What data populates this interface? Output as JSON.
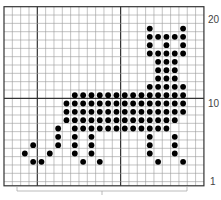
{
  "chart": {
    "title": "",
    "columns": 24,
    "rows_total": 21,
    "grid": {
      "left": 4,
      "top": 6.7,
      "cell": 8.33,
      "cell_h": 8.33,
      "visible_rows": 21.5,
      "line_color": "#9a9a9a",
      "major_line_color": "#333333",
      "border_color": "#333333",
      "major_columns_after": [
        4,
        14
      ],
      "major_rows_above": [
        10
      ]
    },
    "dot_color": "#000000",
    "row_labels": [
      {
        "row": 20,
        "text": "20"
      },
      {
        "row": 10,
        "text": "10"
      },
      {
        "row": 1,
        "text": "1"
      }
    ],
    "stitches": {
      "19": [
        18,
        22
      ],
      "18": [
        18,
        19,
        20,
        21,
        22
      ],
      "17": [
        18,
        20,
        22
      ],
      "16": [
        18,
        19,
        20,
        21,
        22
      ],
      "15": [
        19,
        20,
        21
      ],
      "14": [
        19,
        20,
        21
      ],
      "13": [
        19,
        20,
        21
      ],
      "12": [
        18,
        19,
        20,
        21,
        22
      ],
      "11": [
        9,
        10,
        11,
        12,
        13,
        14,
        15,
        16,
        17,
        18,
        19,
        20,
        21,
        22
      ],
      "10": [
        8,
        9,
        10,
        11,
        12,
        13,
        14,
        15,
        16,
        17,
        18,
        19,
        20,
        21,
        22
      ],
      "9": [
        8,
        9,
        10,
        11,
        12,
        13,
        14,
        15,
        16,
        17,
        18,
        19,
        20,
        21,
        22
      ],
      "8": [
        8,
        9,
        10,
        11,
        12,
        13,
        14,
        15,
        16,
        17,
        18,
        19,
        20,
        21
      ],
      "7": [
        7,
        9,
        10,
        11,
        12,
        13,
        14,
        15,
        16,
        17,
        18,
        19,
        20
      ],
      "6": [
        7,
        9,
        11,
        18,
        21
      ],
      "5": [
        4,
        7,
        9,
        11,
        18,
        21
      ],
      "4": [
        3,
        6,
        9,
        11,
        18,
        21
      ],
      "3": [
        4,
        5,
        10,
        12,
        19,
        22
      ]
    },
    "bracket": {
      "x1": 17,
      "x2": 187,
      "y": 187,
      "tick_y": 191
    },
    "caption": ""
  }
}
